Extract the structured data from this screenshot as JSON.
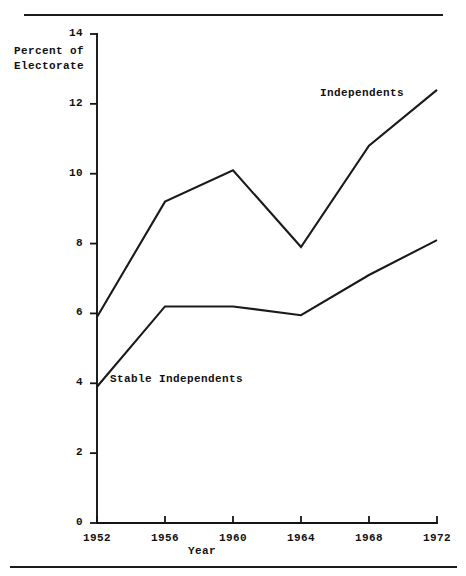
{
  "chart_data": {
    "type": "line",
    "title": "",
    "xlabel": "Year",
    "ylabel": "Percent of Electorate",
    "x": [
      1952,
      1956,
      1960,
      1964,
      1968,
      1972
    ],
    "xtick_labels": [
      "1952",
      "1956",
      "1960",
      "1964",
      "1968",
      "1972"
    ],
    "ytick_labels": [
      "0",
      "2",
      "4",
      "6",
      "8",
      "10",
      "12",
      "14"
    ],
    "yticks": [
      0,
      2,
      4,
      6,
      8,
      10,
      12,
      14
    ],
    "xlim": [
      1952,
      1972
    ],
    "ylim": [
      0,
      14
    ],
    "grid": false,
    "legend": "inline-labels",
    "series": [
      {
        "name": "Independents",
        "values": [
          5.9,
          9.2,
          10.1,
          7.9,
          10.8,
          12.4
        ]
      },
      {
        "name": "Stable Independents",
        "values": [
          3.9,
          6.2,
          6.2,
          5.95,
          7.1,
          8.1
        ]
      }
    ],
    "annotations": [
      {
        "text": "Independents",
        "series": "Independents"
      },
      {
        "text": "Stable Independents",
        "series": "Stable Independents"
      }
    ],
    "axis_label_lines": [
      "Percent of",
      "Electorate"
    ],
    "colors": {
      "line": "#1a1a1a",
      "axis": "#141414",
      "background": "#ffffff"
    }
  }
}
